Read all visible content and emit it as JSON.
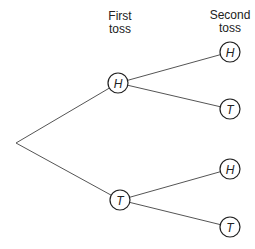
{
  "headers": {
    "first": [
      "First",
      "toss"
    ],
    "second": [
      "Second",
      "toss"
    ]
  },
  "tree": {
    "root": {
      "x": 16,
      "y": 143
    },
    "first_toss": [
      {
        "label": "H",
        "x": 118,
        "y": 83
      },
      {
        "label": "T",
        "x": 120,
        "y": 200
      }
    ],
    "second_toss": [
      {
        "label": "H",
        "x": 230,
        "y": 52,
        "parent": 0
      },
      {
        "label": "T",
        "x": 230,
        "y": 109,
        "parent": 0
      },
      {
        "label": "H",
        "x": 230,
        "y": 169,
        "parent": 1
      },
      {
        "label": "T",
        "x": 230,
        "y": 227,
        "parent": 1
      }
    ]
  },
  "style": {
    "line_color": "#555555",
    "circle_stroke": "#222222"
  }
}
